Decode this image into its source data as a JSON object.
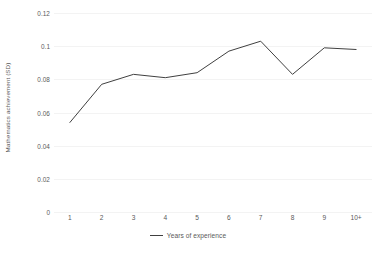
{
  "chart_data": {
    "type": "line",
    "title": "",
    "xlabel": "",
    "ylabel": "Mathematics achievement (SD)",
    "categories": [
      "1",
      "2",
      "3",
      "4",
      "5",
      "6",
      "7",
      "8",
      "9",
      "10+"
    ],
    "values": [
      0.054,
      0.077,
      0.083,
      0.081,
      0.084,
      0.097,
      0.103,
      0.083,
      0.099,
      0.098
    ],
    "series": [
      {
        "name": "Years of experience",
        "values": [
          0.054,
          0.077,
          0.083,
          0.081,
          0.084,
          0.097,
          0.103,
          0.083,
          0.099,
          0.098
        ],
        "color": "#404040"
      }
    ],
    "ylim": [
      0,
      0.12
    ],
    "y_ticks": [
      "0.12",
      "0.1",
      "0.08",
      "0.06",
      "0.04",
      "0.02",
      "0"
    ],
    "y_tick_values": [
      0.12,
      0.1,
      0.08,
      0.06,
      0.04,
      0.02,
      0
    ],
    "x_ticks": [
      "1",
      "2",
      "3",
      "4",
      "5",
      "6",
      "7",
      "8",
      "9",
      "10+"
    ],
    "grid": true,
    "grid_color": "#f3f3f3",
    "legend_position": "bottom",
    "legend": [
      "Years of experience"
    ],
    "line_color": "#404040",
    "background_color": "#ffffff"
  },
  "axes": {
    "y_title": "Mathematics achievement (SD)"
  },
  "legend": {
    "entry_label": "Years of experience"
  },
  "caption": {
    "clipped_text": ""
  }
}
